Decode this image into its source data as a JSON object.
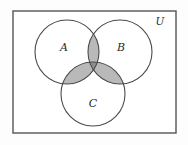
{
  "figure": {
    "type": "venn-diagram",
    "background_color": "#fdfdfd",
    "frame": {
      "label": "U",
      "x": 13,
      "y": 11,
      "width": 163,
      "height": 122,
      "stroke_color": "#555555",
      "stroke_width": 1.4,
      "fill_color": "#ffffff",
      "label_x": 160,
      "label_y": 22
    },
    "circles": [
      {
        "label": "A",
        "cx": 67,
        "cy": 52,
        "r": 32,
        "label_x": 64,
        "label_y": 48
      },
      {
        "label": "B",
        "cx": 120,
        "cy": 52,
        "r": 32,
        "label_x": 121,
        "label_y": 48
      },
      {
        "label": "C",
        "cx": 93,
        "cy": 94,
        "r": 32,
        "label_x": 93,
        "label_y": 104
      }
    ],
    "circle_stroke_color": "#4a4a4a",
    "circle_stroke_width": 1.1,
    "circle_fill_color": "#ffffff",
    "shading": {
      "pairwise_regions": [
        "A ∩ B",
        "A ∩ C",
        "B ∩ C"
      ],
      "pairwise_color": "#b9b9b9",
      "triple_region": "A ∩ B ∩ C",
      "triple_color": "#8c8c8c"
    }
  }
}
